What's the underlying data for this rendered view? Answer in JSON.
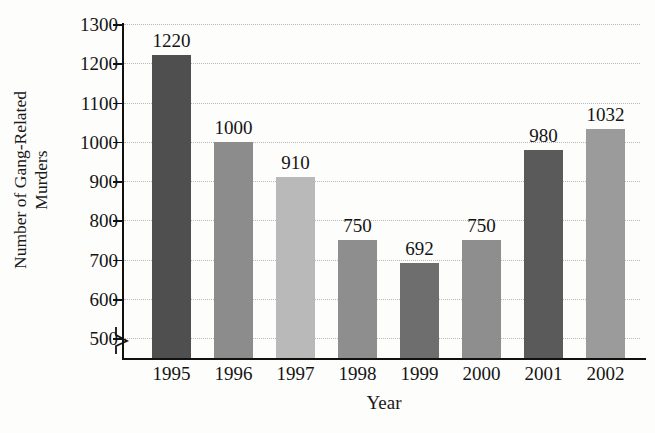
{
  "chart_data": {
    "type": "bar",
    "title": "",
    "xlabel": "Year",
    "ylabel": "Number of Gang-Related Murders",
    "ylabel_lines": [
      "Number of Gang-Related",
      "Murders"
    ],
    "categories": [
      "1995",
      "1996",
      "1997",
      "1998",
      "1999",
      "2000",
      "2001",
      "2002"
    ],
    "values": [
      1220,
      1000,
      910,
      750,
      692,
      750,
      980,
      1032
    ],
    "value_labels": [
      "1220",
      "1000",
      "910",
      "750",
      "692",
      "750",
      "980",
      "1032"
    ],
    "ylim": [
      450,
      1300
    ],
    "yticks": [
      1300,
      1200,
      1100,
      1000,
      900,
      800,
      700,
      600,
      500
    ],
    "ytick_labels": [
      "1300",
      "1200",
      "1100",
      "1000",
      "900",
      "800",
      "700",
      "600",
      "500"
    ],
    "axis_break": true,
    "axis_break_below": 500,
    "grid": true,
    "grid_style": "dotted",
    "legend": "none",
    "bar_colors": [
      "#4f4f4f",
      "#8c8c8c",
      "#b9b9b9",
      "#8e8e8e",
      "#6e6e6e",
      "#8e8e8e",
      "#5a5a5a",
      "#9b9b9b"
    ],
    "colors": {
      "axis": "#111111",
      "grid": "#b9b9b9",
      "text": "#141414",
      "background": "#fdfdfc"
    }
  }
}
